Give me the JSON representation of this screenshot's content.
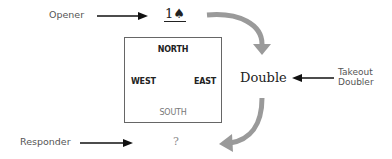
{
  "diagram": {
    "opener_label": "Opener",
    "opening_bid": "1♠",
    "table": {
      "north": "NORTH",
      "west": "WEST",
      "east": "EAST",
      "south": "SOUTH"
    },
    "double_bid": "Double",
    "doubler_label_line1": "Takeout",
    "doubler_label_line2": "Doubler",
    "responder_label": "Responder",
    "responder_bid": "?",
    "colors": {
      "label_text": "#555555",
      "pointer_arrow": "#111111",
      "flow_arrow": "#9a9a9a",
      "box_border": "#666666"
    }
  }
}
